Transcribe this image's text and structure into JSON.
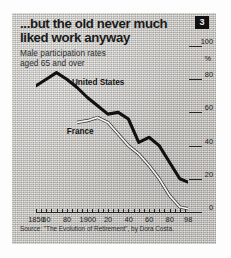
{
  "figure": {
    "badge": "3",
    "title": "...but the old never much liked work anyway",
    "subtitle_line1": "Male participation rates",
    "subtitle_line2": "aged 65 and over",
    "source": "Source: \"The Evolution of Retirement\", by Dora Costa.",
    "colors": {
      "panel": "#c9c7c2",
      "ink": "#1a1a1a",
      "united_states_line": "#111111",
      "france_line": "#f4f4f2",
      "badge_background": "#111111"
    }
  },
  "chart_data": {
    "type": "line",
    "title": "...but the old never much liked work anyway",
    "subtitle": "Male participation rates aged 65 and over",
    "xlabel": "",
    "ylabel": "%",
    "xlim": [
      1850,
      1998
    ],
    "ylim": [
      0,
      100
    ],
    "grid": false,
    "legend": "inline-labels",
    "y_ticks": [
      100,
      80,
      60,
      40,
      20,
      0
    ],
    "y_unit_label": "%",
    "x_ticks": [
      1850,
      1860,
      1880,
      1900,
      1920,
      1940,
      1960,
      1980,
      1998
    ],
    "x_tick_labels": [
      "1850",
      "60",
      "80",
      "1900",
      "20",
      "40",
      "60",
      "80",
      "98"
    ],
    "series": [
      {
        "name": "United States",
        "style": "thick-black",
        "x": [
          1850,
          1860,
          1870,
          1880,
          1890,
          1900,
          1910,
          1920,
          1930,
          1940,
          1950,
          1960,
          1970,
          1980,
          1990,
          1998
        ],
        "values": [
          76,
          80,
          84,
          80,
          75,
          69,
          64,
          59,
          60,
          56,
          42,
          45,
          40,
          30,
          20,
          18
        ]
      },
      {
        "name": "France",
        "style": "thin-white",
        "x": [
          1890,
          1900,
          1910,
          1920,
          1930,
          1940,
          1950,
          1960,
          1970,
          1980,
          1990,
          1998
        ],
        "values": [
          54,
          55,
          57,
          54,
          47,
          40,
          35,
          28,
          20,
          10,
          3,
          2
        ]
      }
    ],
    "annotations": [
      {
        "text": "United States",
        "x": 1885,
        "y": 78
      },
      {
        "text": "France",
        "x": 1880,
        "y": 48
      }
    ]
  }
}
